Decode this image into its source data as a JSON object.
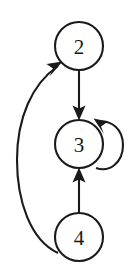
{
  "diagram": {
    "kind": "directed-graph",
    "background_color": "#ffffff",
    "stroke_color": "#1a1a1a",
    "canvas": {
      "width": 131,
      "height": 279
    },
    "nodes": [
      {
        "id": "2",
        "label": "2",
        "cx": 79,
        "cy": 46,
        "r": 24,
        "name": "node-2"
      },
      {
        "id": "3",
        "label": "3",
        "cx": 79,
        "cy": 144,
        "r": 24,
        "name": "node-3"
      },
      {
        "id": "4",
        "label": "4",
        "cx": 79,
        "cy": 237,
        "r": 24,
        "name": "node-4"
      }
    ],
    "edges": [
      {
        "id": "e-2-3",
        "from": "2",
        "to": "3",
        "shape": "straight",
        "direction": "down",
        "label": ""
      },
      {
        "id": "e-4-3",
        "from": "4",
        "to": "3",
        "shape": "straight",
        "direction": "up",
        "label": ""
      },
      {
        "id": "e-4-2",
        "from": "4",
        "to": "2",
        "shape": "curved-left",
        "direction": "up",
        "label": ""
      },
      {
        "id": "e-3-3",
        "from": "3",
        "to": "3",
        "shape": "self-loop-right",
        "direction": "counterclockwise",
        "label": ""
      }
    ]
  }
}
